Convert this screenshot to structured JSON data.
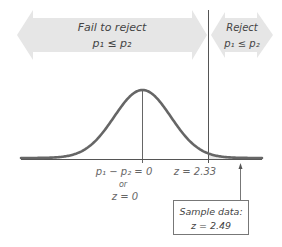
{
  "diagram": {
    "type": "hypothesis-test-normal-curve",
    "colors": {
      "region_arrow": "#e6e6e6",
      "curve": "#666666",
      "axis": "#555555",
      "shade": "#e9e9e9",
      "text": "#555555"
    },
    "regions": {
      "fail_to_reject": {
        "title": "Fail to reject",
        "hypothesis": "p₁ ≤ p₂"
      },
      "reject": {
        "title": "Reject",
        "hypothesis": "p₁ ≤ p₂"
      }
    },
    "axis_labels": {
      "center_line1": "p₁ − p₂ = 0",
      "center_line2": "or",
      "center_line3": "z = 0",
      "critical": "z = 2.33"
    },
    "critical_value": 2.33,
    "sample": {
      "label": "Sample data:",
      "value_text": "z = 2.49",
      "z": 2.49
    }
  }
}
